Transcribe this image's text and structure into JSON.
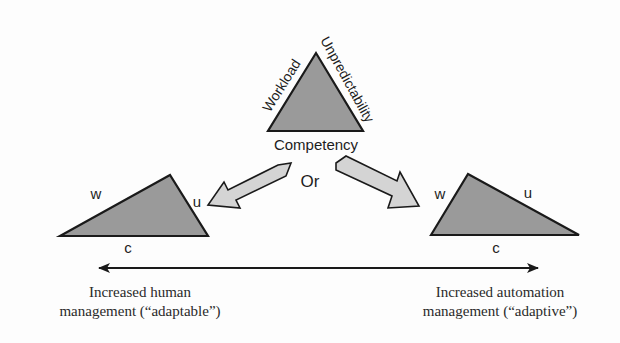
{
  "diagram": {
    "top_triangle": {
      "side_labels": {
        "left": "Workload",
        "right": "Unpredictability",
        "bottom": "Competency"
      }
    },
    "connector_label": "Or",
    "left_triangle": {
      "labels": {
        "w": "w",
        "u": "u",
        "c": "c"
      }
    },
    "right_triangle": {
      "labels": {
        "w": "w",
        "u": "u",
        "c": "c"
      }
    },
    "axis": {
      "left_caption_line1": "Increased human",
      "left_caption_line2": "management (“adaptable”)",
      "right_caption_line1": "Increased automation",
      "right_caption_line2": "management (“adaptive”)"
    },
    "colors": {
      "triangle_fill": "#9a9a9a",
      "arrow_fill": "#d4d4d4",
      "stroke": "#1a1a1a"
    }
  }
}
